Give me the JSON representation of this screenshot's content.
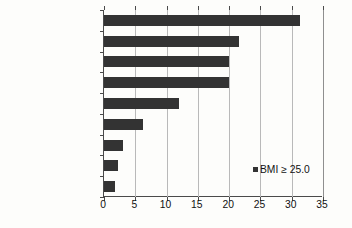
{
  "chart_data": {
    "type": "bar",
    "orientation": "horizontal",
    "title": "",
    "xlabel": "",
    "ylabel": "",
    "xlim": [
      0,
      35
    ],
    "xticks": [
      "0",
      "5",
      "10",
      "15",
      "20",
      "25",
      "30",
      "35"
    ],
    "grid": true,
    "legend_position": "inside-right",
    "categories": [
      "United States",
      "Brazil",
      "Colombia",
      "Argentina",
      "France",
      "Democratic Republic of Congo",
      "Ethiopia",
      "India",
      "Bangladesh"
    ],
    "category_labels": [
      {
        "line1": "United States",
        "superscript": "a",
        "line2": ""
      },
      {
        "line1": "Brazil",
        "superscript": "",
        "line2": ""
      },
      {
        "line1": "Colombia",
        "superscript": "",
        "line2": ""
      },
      {
        "line1": "Argentina",
        "superscript": "",
        "line2": ""
      },
      {
        "line1": "France",
        "superscript": "",
        "line2": ""
      },
      {
        "line1": "Democratic",
        "superscript": "",
        "line2": "Republic of Congo"
      },
      {
        "line1": "Ethiopia",
        "superscript": "",
        "line2": ""
      },
      {
        "line1": "India",
        "superscript": "",
        "line2": ""
      },
      {
        "line1": "Bangladesh",
        "superscript": "",
        "line2": ""
      }
    ],
    "series": [
      {
        "name": "BMI ≥ 25.0",
        "color": "#333333",
        "values": [
          31.3,
          21.5,
          20.0,
          20.0,
          12.0,
          6.3,
          3.0,
          2.3,
          1.8
        ]
      }
    ],
    "legend": [
      {
        "label": "BMI ≥ 25.0",
        "color": "#333333"
      }
    ]
  },
  "colors": {
    "bar": "#333333",
    "axis": "#4a4a4a",
    "gridline": "#b9b9b9",
    "background": "#fdfdfb",
    "text": "#111111"
  }
}
